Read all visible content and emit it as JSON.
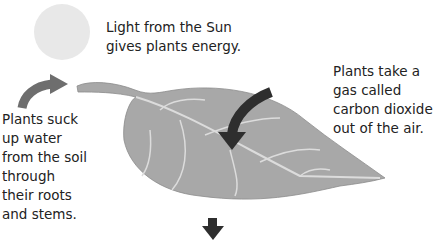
{
  "diagram": {
    "labels": {
      "sun": [
        "Light from the Sun",
        "gives plants energy."
      ],
      "water": [
        "Plants suck",
        "up water",
        "from the soil",
        "through",
        "their roots",
        "and stems."
      ],
      "co2": [
        "Plants take a",
        "gas called",
        "carbon dioxide",
        "out of the air."
      ]
    },
    "colors": {
      "sun": "#e8e8e8",
      "leaf": "#a8a8a8",
      "leaf_vein": "#dcdcdc",
      "arrow_dark": "#2e2e2e",
      "arrow_mid": "#6e6e6e",
      "text": "#222222"
    }
  }
}
